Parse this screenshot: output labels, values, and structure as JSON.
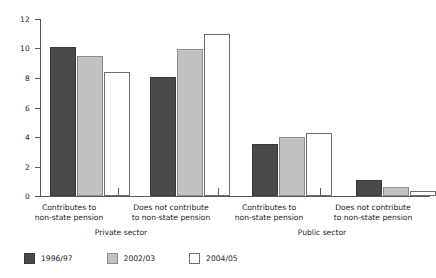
{
  "chart_data": {
    "type": "bar",
    "title": "",
    "xlabel": "",
    "ylabel": "Millions",
    "ylim": [
      0,
      12
    ],
    "yticks": [
      "0",
      "2",
      "4",
      "6",
      "8",
      "10",
      "12"
    ],
    "grid": false,
    "legend_position": "bottom-left",
    "categories": [
      "Contributes to non-state pension",
      "Does not contribute to non-state pension",
      "Contributes to non-state pension",
      "Does not contribute to non-state pension"
    ],
    "category_lines": [
      [
        "Contributes to",
        "non-state pension"
      ],
      [
        "Does not contribute",
        "to non-state pension"
      ],
      [
        "Contributes to",
        "non-state pension"
      ],
      [
        "Does not contribute",
        "to non-state pension"
      ]
    ],
    "groups": [
      "Private sector",
      "Public sector"
    ],
    "series": [
      {
        "name": "1996/97",
        "color": "#4a4a4a",
        "values": [
          10.1,
          8.1,
          3.5,
          1.1
        ]
      },
      {
        "name": "2002/03",
        "color": "#c2c2c2",
        "values": [
          9.5,
          10.0,
          4.0,
          0.6
        ]
      },
      {
        "name": "2004/05",
        "color": "#ffffff",
        "values": [
          8.4,
          11.0,
          4.3,
          0.35
        ]
      }
    ]
  },
  "axis": {
    "y_label": "Millions",
    "tick_12": "12",
    "tick_10": "10",
    "tick_8": "8",
    "tick_6": "6",
    "tick_4": "4",
    "tick_2": "2",
    "tick_0": "0"
  },
  "categories": {
    "c0_l1": "Contributes to",
    "c0_l2": "non-state pension",
    "c1_l1": "Does not contribute",
    "c1_l2": "to non-state pension",
    "c2_l1": "Contributes to",
    "c2_l2": "non-state pension",
    "c3_l1": "Does not contribute",
    "c3_l2": "to non-state pension",
    "g0": "Private sector",
    "g1": "Public sector"
  },
  "legend": {
    "items": [
      {
        "label": "1996/97"
      },
      {
        "label": "2002/03"
      },
      {
        "label": "2004/05"
      }
    ]
  }
}
